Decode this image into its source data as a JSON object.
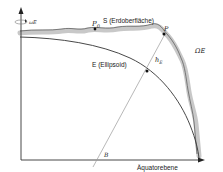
{
  "diagram": {
    "labels": {
      "rotation": "ωE",
      "point_p0": "P",
      "point_p0_sub": "0",
      "surface": "S (Erdoberfläche)",
      "point_p": "P",
      "omega_e": "ΩE",
      "ellipsoid": "E (Ellipsoid)",
      "height": "h",
      "height_sub": "E",
      "point_b": "B",
      "equator": "Äquatorebene"
    },
    "colors": {
      "line": "#333333",
      "surface_band": "#c8c8c8",
      "normal_line": "#9a9a9a"
    }
  }
}
